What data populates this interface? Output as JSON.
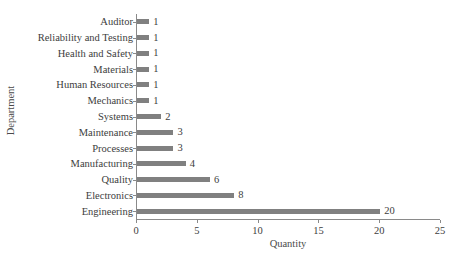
{
  "chart_data": {
    "type": "bar",
    "orientation": "horizontal",
    "title": "",
    "xlabel": "Quantity",
    "ylabel": "Department",
    "categories": [
      "Auditor",
      "Reliability and Testing",
      "Health and Safety",
      "Materials",
      "Human Resources",
      "Mechanics",
      "Systems",
      "Maintenance",
      "Processes",
      "Manufacturing",
      "Quality",
      "Electronics",
      "Engineering"
    ],
    "values": [
      1,
      1,
      1,
      1,
      1,
      1,
      2,
      3,
      3,
      4,
      6,
      8,
      20
    ],
    "value_labels": [
      "1",
      "1",
      "1",
      "1",
      "1",
      "1",
      "2",
      "3",
      "3",
      "4",
      "6",
      "8",
      "20"
    ],
    "xlim": [
      0,
      25
    ],
    "xticks": [
      0,
      5,
      10,
      15,
      20,
      25
    ],
    "xtick_labels": [
      "0",
      "5",
      "10",
      "15",
      "20",
      "25"
    ],
    "grid": false,
    "legend": false,
    "bar_color": "#808080",
    "axis_color": "#8a8a8a",
    "text_color": "#3d3d3d",
    "background": "#ffffff"
  }
}
